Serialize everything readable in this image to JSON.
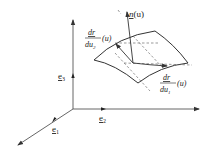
{
  "figure": {
    "colors": {
      "line": "#333333",
      "dashed": "#555555",
      "text": "#222222",
      "background": "#ffffff"
    },
    "axes": {
      "e1": {
        "symbol": "e",
        "subscript": "1"
      },
      "e2": {
        "symbol": "e",
        "subscript": "2"
      },
      "e3": {
        "symbol": "e",
        "subscript": "3"
      }
    },
    "normal": {
      "label": "n(u)",
      "symbol": "n",
      "arg": "(u)"
    },
    "tangent_u1": {
      "numerator": "dr",
      "denominator_base": "du",
      "denominator_sub": "1",
      "arg": "(u)"
    },
    "tangent_u2": {
      "numerator": "dr",
      "denominator_base": "du",
      "denominator_sub": "2",
      "arg": "(u)"
    }
  }
}
